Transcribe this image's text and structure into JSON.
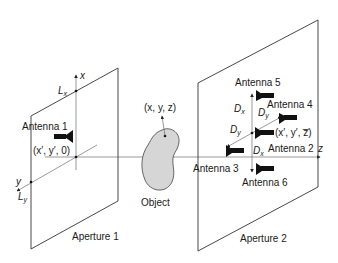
{
  "diagram": {
    "aperture1": {
      "label": "Aperture 1",
      "axis_x_label": "x",
      "axis_y_label": "y",
      "lx_label": "L",
      "lx_sub": "x",
      "ly_label": "L",
      "ly_sub": "y",
      "antenna_label": "Antenna 1",
      "point_label": "(x′, y′, 0)"
    },
    "object": {
      "label": "Object",
      "point_label": "(x, y, z)"
    },
    "aperture2": {
      "label": "Aperture 2",
      "axis_z_label": "z",
      "point_label": "(x′, y′, z̅)",
      "antennas": [
        {
          "id": 2,
          "label": "Antenna 2"
        },
        {
          "id": 3,
          "label": "Antenna 3"
        },
        {
          "id": 4,
          "label": "Antenna 4"
        },
        {
          "id": 5,
          "label": "Antenna 5"
        },
        {
          "id": 6,
          "label": "Antenna 6"
        }
      ],
      "dx_label": "D",
      "dx_sub": "x",
      "dy_label": "D",
      "dy_sub": "y"
    },
    "colors": {
      "object_fill": "#d6d6d6",
      "line": "#333333",
      "antenna": "#111111"
    }
  }
}
